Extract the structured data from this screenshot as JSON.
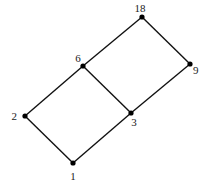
{
  "diagram": {
    "type": "hasse-diagram",
    "nodes": [
      {
        "id": "1",
        "label": "1",
        "x": 73,
        "y": 163,
        "lx": 73,
        "ly": 180,
        "anchor": "middle"
      },
      {
        "id": "2",
        "label": "2",
        "x": 25,
        "y": 116,
        "lx": 17,
        "ly": 120,
        "anchor": "end"
      },
      {
        "id": "3",
        "label": "3",
        "x": 131,
        "y": 113,
        "lx": 134,
        "ly": 126,
        "anchor": "middle"
      },
      {
        "id": "6",
        "label": "6",
        "x": 83,
        "y": 66,
        "lx": 78,
        "ly": 62,
        "anchor": "middle"
      },
      {
        "id": "9",
        "label": "9",
        "x": 190,
        "y": 64,
        "lx": 193,
        "ly": 74,
        "anchor": "start"
      },
      {
        "id": "18",
        "label": "18",
        "x": 142,
        "y": 17,
        "lx": 140,
        "ly": 12,
        "anchor": "middle"
      }
    ],
    "edges": [
      {
        "from": "1",
        "to": "2"
      },
      {
        "from": "1",
        "to": "3"
      },
      {
        "from": "2",
        "to": "6"
      },
      {
        "from": "3",
        "to": "6"
      },
      {
        "from": "3",
        "to": "9"
      },
      {
        "from": "6",
        "to": "18"
      },
      {
        "from": "9",
        "to": "18"
      }
    ]
  }
}
